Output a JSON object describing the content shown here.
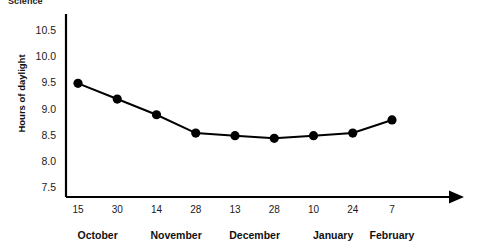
{
  "top_caption": "Science",
  "chart_data": {
    "type": "line",
    "title": "",
    "xlabel": "",
    "ylabel": "Hours of daylight",
    "ylim": [
      7.5,
      10.5
    ],
    "ytick_step": 0.5,
    "ytick_labels": [
      "10.5",
      "10.0",
      "9.5",
      "9.0",
      "8.5",
      "8.0",
      "7.5"
    ],
    "ytick_values": [
      10.5,
      10.0,
      9.5,
      9.0,
      8.5,
      8.0,
      7.5
    ],
    "grid": false,
    "legend": false,
    "axis_arrow_x": true,
    "categories": [
      "15",
      "30",
      "14",
      "28",
      "13",
      "28",
      "10",
      "24",
      "7"
    ],
    "x_group_labels": [
      "October",
      "November",
      "December",
      "January",
      "February"
    ],
    "x_groups": [
      {
        "label": "October",
        "ticks": [
          "15",
          "30"
        ]
      },
      {
        "label": "November",
        "ticks": [
          "14",
          "28"
        ]
      },
      {
        "label": "December",
        "ticks": [
          "13",
          "28"
        ]
      },
      {
        "label": "January",
        "ticks": [
          "10",
          "24"
        ]
      },
      {
        "label": "February",
        "ticks": [
          "7"
        ]
      }
    ],
    "values": [
      9.5,
      9.2,
      8.9,
      8.55,
      8.5,
      8.45,
      8.5,
      8.55,
      8.8
    ],
    "marker": "filled-circle",
    "line_color": "#000000",
    "marker_color": "#000000"
  },
  "colors": {
    "axis": "#000000",
    "text": "#111111",
    "background": "#ffffff"
  }
}
